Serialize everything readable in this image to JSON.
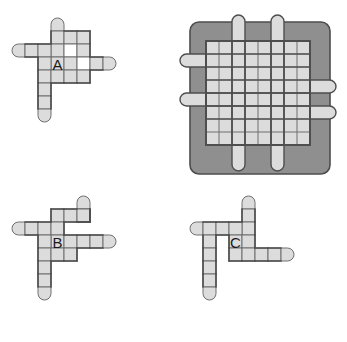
{
  "figure": {
    "title": "",
    "background_color": "#ffffff",
    "colors": {
      "cell_fill": "#dcdcdc",
      "cell_stroke": "#6e6e6e",
      "outline": "#4d4d4d",
      "tray_frame": "#8f8f8f",
      "tray_frame_stroke": "#4d4d4d",
      "hole_fill": "#ffffff",
      "label_color": "#1a1a1a"
    },
    "cell_size": 13
  },
  "pieces": [
    {
      "id": "A",
      "label": "A",
      "label_cell": [
        3,
        3
      ],
      "origin": [
        12,
        18
      ],
      "cells": [
        [
          3,
          0
        ],
        [
          3,
          1
        ],
        [
          4,
          1
        ],
        [
          5,
          1
        ],
        [
          3,
          2
        ],
        [
          4,
          2
        ],
        [
          5,
          2
        ],
        [
          0,
          2
        ],
        [
          1,
          2
        ],
        [
          2,
          2
        ],
        [
          3,
          3
        ],
        [
          4,
          3
        ],
        [
          5,
          3
        ],
        [
          6,
          3
        ],
        [
          7,
          3
        ],
        [
          2,
          3
        ],
        [
          2,
          4
        ],
        [
          2,
          5
        ],
        [
          2,
          6
        ],
        [
          2,
          7
        ],
        [
          3,
          4
        ],
        [
          4,
          4
        ],
        [
          5,
          4
        ]
      ],
      "holes": [
        [
          4,
          2
        ],
        [
          5,
          3
        ]
      ],
      "rounded_ends": [
        {
          "cell": [
            3,
            0
          ],
          "side": "top"
        },
        {
          "cell": [
            0,
            2
          ],
          "side": "left"
        },
        {
          "cell": [
            7,
            3
          ],
          "side": "right"
        },
        {
          "cell": [
            2,
            7
          ],
          "side": "bottom"
        }
      ],
      "arm_counts": {
        "up": 3,
        "left": 3,
        "right": 3,
        "down": 4
      }
    },
    {
      "id": "B",
      "label": "B",
      "label_cell": [
        3,
        3
      ],
      "origin": [
        12,
        196
      ],
      "cells": [
        [
          5,
          0
        ],
        [
          5,
          1
        ],
        [
          3,
          1
        ],
        [
          4,
          1
        ],
        [
          5,
          1
        ],
        [
          0,
          2
        ],
        [
          1,
          2
        ],
        [
          2,
          2
        ],
        [
          3,
          2
        ],
        [
          3,
          3
        ],
        [
          4,
          3
        ],
        [
          5,
          3
        ],
        [
          6,
          3
        ],
        [
          7,
          3
        ],
        [
          2,
          3
        ],
        [
          2,
          4
        ],
        [
          2,
          5
        ],
        [
          2,
          6
        ],
        [
          2,
          7
        ],
        [
          3,
          4
        ],
        [
          4,
          4
        ]
      ],
      "holes": [],
      "rounded_ends": [
        {
          "cell": [
            5,
            0
          ],
          "side": "top"
        },
        {
          "cell": [
            0,
            2
          ],
          "side": "left"
        },
        {
          "cell": [
            7,
            3
          ],
          "side": "right"
        },
        {
          "cell": [
            2,
            7
          ],
          "side": "bottom"
        }
      ],
      "arm_counts": {
        "up": 2,
        "left": 4,
        "right": 4,
        "down": 4
      }
    },
    {
      "id": "C",
      "label": "C",
      "label_cell": [
        3,
        3
      ],
      "origin": [
        190,
        196
      ],
      "cells": [
        [
          4,
          0
        ],
        [
          4,
          1
        ],
        [
          4,
          2
        ],
        [
          0,
          2
        ],
        [
          1,
          2
        ],
        [
          2,
          2
        ],
        [
          3,
          2
        ],
        [
          3,
          3
        ],
        [
          4,
          3
        ],
        [
          1,
          3
        ],
        [
          1,
          4
        ],
        [
          1,
          5
        ],
        [
          1,
          6
        ],
        [
          1,
          7
        ],
        [
          3,
          4
        ],
        [
          4,
          4
        ],
        [
          5,
          4
        ],
        [
          6,
          4
        ],
        [
          7,
          4
        ]
      ],
      "holes": [],
      "rounded_ends": [
        {
          "cell": [
            4,
            0
          ],
          "side": "top"
        },
        {
          "cell": [
            0,
            2
          ],
          "side": "left"
        },
        {
          "cell": [
            7,
            4
          ],
          "side": "right"
        },
        {
          "cell": [
            1,
            7
          ],
          "side": "bottom"
        }
      ],
      "arm_counts": {
        "up": 3,
        "left": 4,
        "right": 4,
        "down": 4
      }
    }
  ],
  "tray": {
    "id": "tray",
    "label": "",
    "origin": [
      190,
      22
    ],
    "frame": {
      "x": 0,
      "y": 0,
      "width": 140,
      "height": 152,
      "radius": 9
    },
    "grid": {
      "x": 16,
      "y": 19,
      "columns": 8,
      "rows": 8,
      "cell": 13
    },
    "tabs": [
      {
        "side": "top",
        "index": 2,
        "length": 2
      },
      {
        "side": "top",
        "index": 5,
        "length": 2
      },
      {
        "side": "left",
        "index": 1,
        "length": 2
      },
      {
        "side": "left",
        "index": 4,
        "length": 2
      },
      {
        "side": "right",
        "index": 3,
        "length": 2
      },
      {
        "side": "right",
        "index": 5,
        "length": 2
      },
      {
        "side": "bottom",
        "index": 2,
        "length": 2
      },
      {
        "side": "bottom",
        "index": 5,
        "length": 2
      }
    ]
  }
}
